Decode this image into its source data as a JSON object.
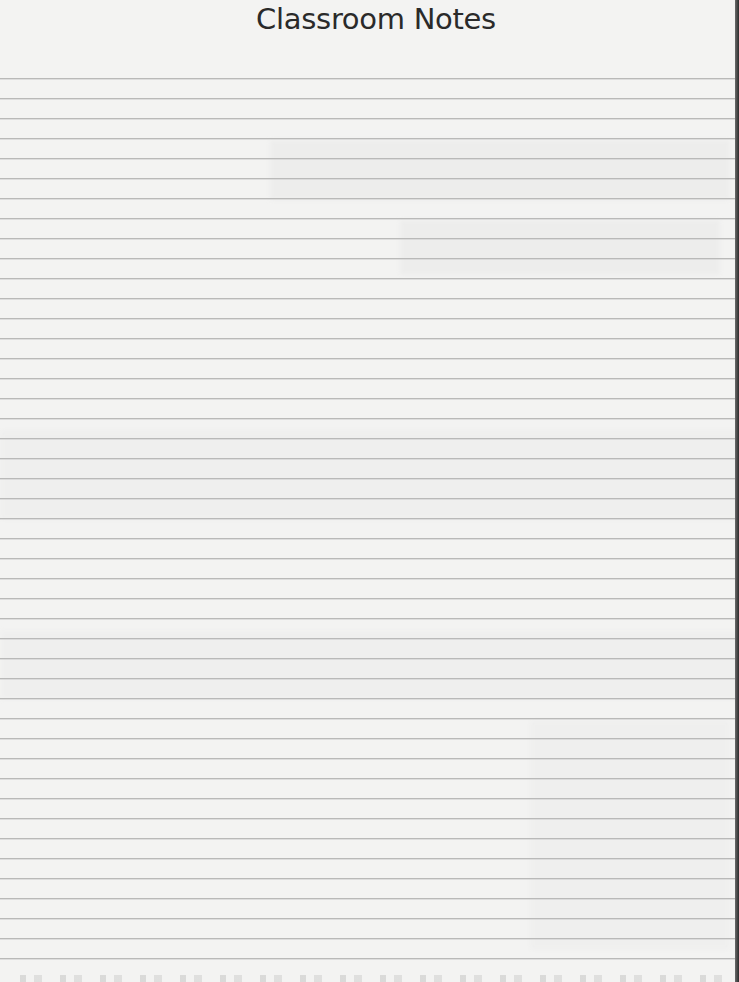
{
  "document": {
    "title": "Classroom Notes",
    "type": "lined-notepaper"
  },
  "layout": {
    "rule_start_y": 78,
    "rule_pitch": 20,
    "rule_count": 45
  },
  "colors": {
    "paper": "#f3f3f2",
    "rule": "#b9b9b8",
    "title": "#2a2a2a",
    "edge": "#2c2c2c"
  }
}
